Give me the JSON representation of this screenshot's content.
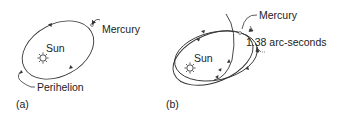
{
  "panel_a": {
    "label": "(a)",
    "sun_label": "Sun",
    "planet_label": "Mercury",
    "point_label": "Perihelion"
  },
  "panel_b": {
    "label": "(b)",
    "sun_label": "Sun",
    "planet_label": "Mercury",
    "precession_label": "1.38 arc-seconds"
  },
  "colors": {
    "line": "#333333",
    "text": "#222222",
    "background": "#ffffff"
  }
}
